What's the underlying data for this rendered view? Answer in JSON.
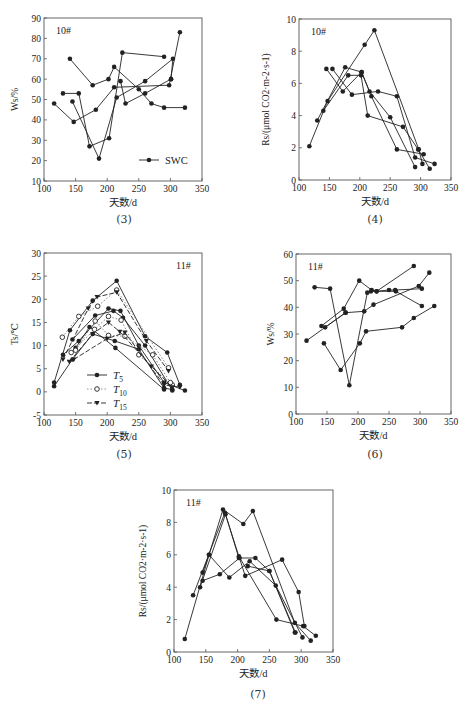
{
  "figure": {
    "panels": [
      "(3)",
      "(4)",
      "(5)",
      "(6)",
      "(7)"
    ]
  },
  "chart_data": [
    {
      "id": "3",
      "type": "line",
      "caption": "(3)",
      "site_label": "10#",
      "xlabel": "天数/d",
      "ylabel": "Ws/%",
      "xlim": [
        100,
        350
      ],
      "ylim": [
        10,
        90
      ],
      "xticks": [
        100,
        150,
        200,
        250,
        300,
        350
      ],
      "yticks": [
        10,
        20,
        30,
        40,
        50,
        60,
        70,
        80,
        90
      ],
      "legend": [
        {
          "label": "SWC",
          "marker": "filled-circle"
        }
      ],
      "series": [
        {
          "name": "SWC-a",
          "points": [
            [
              116,
              48
            ],
            [
              147,
              39
            ],
            [
              182,
              45
            ],
            [
              211,
              56
            ],
            [
              298,
              57
            ],
            [
              315,
              83
            ]
          ]
        },
        {
          "name": "SWC-b",
          "points": [
            [
              130,
              53
            ],
            [
              155,
              53
            ],
            [
              172,
              27
            ],
            [
              203,
              31
            ],
            [
              224,
              73
            ],
            [
              290,
              71
            ]
          ]
        },
        {
          "name": "SWC-c",
          "points": [
            [
              141,
              70
            ],
            [
              177,
              57
            ],
            [
              202,
              60
            ],
            [
              211,
              66
            ],
            [
              250,
              55
            ],
            [
              270,
              48
            ],
            [
              290,
              46
            ],
            [
              323,
              46
            ]
          ]
        },
        {
          "name": "SWC-d",
          "points": [
            [
              145,
              49
            ],
            [
              187,
              21
            ],
            [
              215,
              51
            ],
            [
              260,
              59
            ],
            [
              304,
              70
            ],
            [
              301,
              60
            ]
          ]
        },
        {
          "name": "SWC-e",
          "points": [
            [
              221,
              59
            ],
            [
              229,
              48
            ],
            [
              260,
              53
            ],
            [
              301,
              60
            ]
          ]
        }
      ]
    },
    {
      "id": "4",
      "type": "line",
      "caption": "(4)",
      "site_label": "10#",
      "xlabel": "天数/d",
      "ylabel": "Rs/(μmol CO2·m-2·s-1)",
      "xlim": [
        100,
        350
      ],
      "ylim": [
        0,
        10
      ],
      "xticks": [
        100,
        150,
        200,
        250,
        300,
        350
      ],
      "yticks": [
        0,
        2,
        4,
        6,
        8,
        10
      ],
      "series": [
        {
          "name": "Rs-a",
          "points": [
            [
              117,
              2.1
            ],
            [
              147,
              4.9
            ],
            [
              208,
              8.4
            ],
            [
              224,
              9.3
            ],
            [
              297,
              1.9
            ],
            [
              303,
              1.0
            ]
          ]
        },
        {
          "name": "Rs-b",
          "points": [
            [
              130,
              3.7
            ],
            [
              176,
              7.0
            ],
            [
              203,
              6.7
            ],
            [
              219,
              5.2
            ],
            [
              261,
              1.9
            ],
            [
              305,
              1.6
            ]
          ]
        },
        {
          "name": "Rs-c",
          "points": [
            [
              140,
              4.3
            ],
            [
              181,
              6.5
            ],
            [
              202,
              6.5
            ],
            [
              213,
              4.0
            ],
            [
              271,
              3.3
            ],
            [
              296,
              1.9
            ],
            [
              315,
              0.7
            ]
          ]
        },
        {
          "name": "Rs-d",
          "points": [
            [
              145,
              6.9
            ],
            [
              172,
              5.5
            ],
            [
              203,
              6.7
            ],
            [
              216,
              5.5
            ],
            [
              250,
              3.9
            ],
            [
              291,
              0.8
            ]
          ]
        },
        {
          "name": "Rs-e",
          "points": [
            [
              155,
              6.9
            ],
            [
              187,
              5.3
            ],
            [
              230,
              5.5
            ],
            [
              261,
              5.2
            ],
            [
              291,
              1.4
            ],
            [
              323,
              1.0
            ]
          ]
        }
      ]
    },
    {
      "id": "5",
      "type": "line",
      "caption": "(5)",
      "site_label": "11#",
      "xlabel": "天数/d",
      "ylabel": "Ts/℃",
      "xlim": [
        100,
        350
      ],
      "ylim": [
        -5,
        30
      ],
      "xticks": [
        100,
        150,
        200,
        250,
        300,
        350
      ],
      "yticks": [
        -5,
        0,
        5,
        10,
        15,
        20,
        25,
        30
      ],
      "legend": [
        {
          "label": "T5",
          "marker": "filled-circle",
          "line": "solid"
        },
        {
          "label": "T10",
          "marker": "open-circle",
          "line": "dotted"
        },
        {
          "label": "T15",
          "marker": "filled-triangle-down",
          "line": "dash"
        }
      ],
      "series": [
        {
          "name": "T5-a",
          "points": [
            [
              116,
              2.0
            ],
            [
              141,
              13.3
            ],
            [
              177,
              19.7
            ],
            [
              215,
              24.0
            ],
            [
              260,
              12.0
            ],
            [
              295,
              8.5
            ],
            [
              315,
              1.5
            ]
          ]
        },
        {
          "name": "T5-b",
          "points": [
            [
              130,
              8.0
            ],
            [
              155,
              11.0
            ],
            [
              202,
              18.0
            ],
            [
              221,
              17.5
            ],
            [
              250,
              10.0
            ],
            [
              290,
              2.0
            ],
            [
              323,
              0.3
            ]
          ]
        },
        {
          "name": "T5-c",
          "points": [
            [
              145,
              11.3
            ],
            [
              181,
              16.5
            ],
            [
              210,
              17.5
            ],
            [
              225,
              16.0
            ],
            [
              260,
              10.0
            ],
            [
              303,
              0.3
            ]
          ]
        },
        {
          "name": "T5-d",
          "points": [
            [
              116,
              1.2
            ],
            [
              145,
              7.0
            ],
            [
              177,
              12.5
            ],
            [
              212,
              11.0
            ],
            [
              250,
              9.2
            ],
            [
              290,
              0.8
            ],
            [
              303,
              0.5
            ]
          ]
        },
        {
          "name": "T5-e",
          "points": [
            [
              150,
              9.5
            ],
            [
              172,
              14.0
            ],
            [
              213,
              9.5
            ],
            [
              290,
              0.5
            ]
          ]
        },
        {
          "name": "T10-a",
          "points": [
            [
              129,
              11.8
            ],
            [
              155,
              16.3
            ],
            [
              185,
              18.5
            ],
            [
              215,
              22.0
            ],
            [
              297,
              5.2
            ]
          ]
        },
        {
          "name": "T10-b",
          "points": [
            [
              143,
              8.5
            ],
            [
              180,
              13.5
            ],
            [
              202,
              16.3
            ],
            [
              222,
              15.5
            ],
            [
              250,
              8.0
            ],
            [
              303,
              1.5
            ]
          ]
        },
        {
          "name": "T10-c",
          "points": [
            [
              150,
              9.0
            ],
            [
              181,
              15.3
            ],
            [
              202,
              12.2
            ],
            [
              228,
              12.0
            ],
            [
              272,
              8.0
            ],
            [
              300,
              2.0
            ]
          ]
        },
        {
          "name": "T15-a",
          "points": [
            [
              130,
              7.0
            ],
            [
              170,
              18.0
            ],
            [
              184,
              20.5
            ],
            [
              215,
              21.5
            ],
            [
              262,
              11.0
            ],
            [
              297,
              4.5
            ]
          ]
        },
        {
          "name": "T15-b",
          "points": [
            [
              140,
              6.5
            ],
            [
              177,
              12.5
            ],
            [
              202,
              15.0
            ],
            [
              220,
              13.0
            ],
            [
              270,
              5.5
            ],
            [
              303,
              1.0
            ]
          ]
        },
        {
          "name": "T15-c",
          "points": [
            [
              147,
              7.0
            ],
            [
              200,
              11.5
            ],
            [
              228,
              12.8
            ],
            [
              290,
              1.5
            ],
            [
              315,
              1.0
            ]
          ]
        }
      ]
    },
    {
      "id": "6",
      "type": "line",
      "caption": "(6)",
      "site_label": "11#",
      "xlabel": "天数/d",
      "ylabel": "Ws/%",
      "xlim": [
        100,
        350
      ],
      "ylim": [
        0,
        60
      ],
      "xticks": [
        100,
        150,
        200,
        250,
        300,
        350
      ],
      "yticks": [
        0,
        10,
        20,
        30,
        40,
        50,
        60
      ],
      "series": [
        {
          "name": "SWC-a",
          "points": [
            [
              117,
              27.5
            ],
            [
              180,
              38.0
            ],
            [
              210,
              38.5
            ],
            [
              225,
              41.0
            ],
            [
              298,
              48.0
            ],
            [
              315,
              53.0
            ]
          ]
        },
        {
          "name": "SWC-b",
          "points": [
            [
              130,
              47.5
            ],
            [
              155,
              47.0
            ],
            [
              186,
              10.8
            ],
            [
              215,
              45.5
            ],
            [
              221,
              46.0
            ],
            [
              261,
              46.0
            ],
            [
              303,
              40.5
            ]
          ]
        },
        {
          "name": "SWC-c",
          "points": [
            [
              141,
              33.0
            ],
            [
              177,
              39.5
            ],
            [
              202,
              50.0
            ],
            [
              222,
              46.5
            ],
            [
              230,
              46.0
            ],
            [
              290,
              55.5
            ]
          ]
        },
        {
          "name": "SWC-d",
          "points": [
            [
              145,
              26.5
            ],
            [
              172,
              16.5
            ],
            [
              203,
              26.5
            ],
            [
              213,
              31.0
            ],
            [
              271,
              32.5
            ],
            [
              290,
              36.0
            ],
            [
              323,
              40.5
            ]
          ]
        },
        {
          "name": "SWC-e",
          "points": [
            [
              147,
              32.5
            ],
            [
              180,
              38.0
            ]
          ]
        },
        {
          "name": "SWC-f",
          "points": [
            [
              230,
              46.0
            ],
            [
              250,
              46.5
            ],
            [
              260,
              46.5
            ],
            [
              303,
              47.0
            ]
          ]
        }
      ]
    },
    {
      "id": "7",
      "type": "line",
      "caption": "(7)",
      "site_label": "11#",
      "xlabel": "天数/d",
      "ylabel": "Rs/(μmol CO2·m-2·s-1)",
      "xlim": [
        100,
        350
      ],
      "ylim": [
        0,
        10
      ],
      "xticks": [
        100,
        150,
        200,
        250,
        300,
        350
      ],
      "yticks": [
        0,
        2,
        4,
        6,
        8,
        10
      ],
      "series": [
        {
          "name": "Rs-a",
          "points": [
            [
              117,
              0.8
            ],
            [
              155,
              6.0
            ],
            [
              177,
              8.8
            ],
            [
              209,
              7.9
            ],
            [
              224,
              8.7
            ],
            [
              290,
              1.8
            ],
            [
              315,
              0.7
            ]
          ]
        },
        {
          "name": "Rs-b",
          "points": [
            [
              130,
              3.5
            ],
            [
              180,
              8.6
            ],
            [
              202,
              5.9
            ],
            [
              261,
              2.0
            ],
            [
              303,
              1.6
            ],
            [
              323,
              1.0
            ]
          ]
        },
        {
          "name": "Rs-c",
          "points": [
            [
              141,
              4.0
            ],
            [
              181,
              8.5
            ],
            [
              202,
              5.8
            ],
            [
              228,
              5.8
            ],
            [
              250,
              5.0
            ],
            [
              291,
              1.2
            ]
          ]
        },
        {
          "name": "Rs-d",
          "points": [
            [
              145,
              4.4
            ],
            [
              172,
              4.8
            ],
            [
              203,
              5.8
            ],
            [
              212,
              4.7
            ],
            [
              270,
              5.7
            ],
            [
              296,
              3.7
            ],
            [
              305,
              1.6
            ]
          ]
        },
        {
          "name": "Rs-e",
          "points": [
            [
              145,
              4.9
            ],
            [
              155,
              6.0
            ],
            [
              187,
              4.6
            ],
            [
              219,
              5.6
            ],
            [
              260,
              4.1
            ],
            [
              302,
              0.9
            ]
          ]
        },
        {
          "name": "Rs-f",
          "points": [
            [
              216,
              5.3
            ],
            [
              250,
              5.0
            ],
            [
              290,
              1.2
            ]
          ]
        }
      ]
    }
  ]
}
